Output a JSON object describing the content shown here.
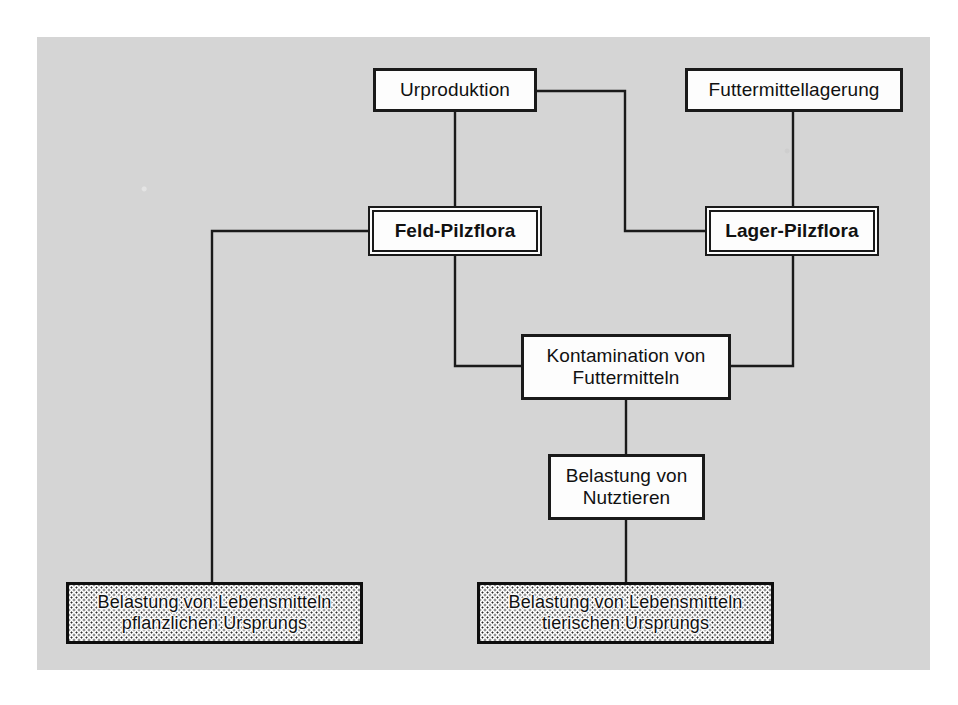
{
  "diagram": {
    "panel_color": "#d5d5d5",
    "line_color": "#1a1a1a",
    "box_fill": "#fdfdfd",
    "text_color": "#111111",
    "nodes": [
      {
        "id": "urproduktion",
        "label": "Urproduktion",
        "style": "plain",
        "x": 373,
        "y": 68,
        "w": 164,
        "h": 44
      },
      {
        "id": "futtermittellagerung",
        "label": "Futtermittellagerung",
        "style": "plain",
        "x": 685,
        "y": 68,
        "w": 218,
        "h": 44
      },
      {
        "id": "feld-pilzflora",
        "label": "Feld-Pilzflora",
        "style": "double",
        "x": 372,
        "y": 210,
        "w": 166,
        "h": 42
      },
      {
        "id": "lager-pilzflora",
        "label": "Lager-Pilzflora",
        "style": "double",
        "x": 709,
        "y": 210,
        "w": 166,
        "h": 42
      },
      {
        "id": "kontamination-von-futtermitteln",
        "label": "Kontamination von\nFuttermitteln",
        "style": "plain",
        "x": 521,
        "y": 334,
        "w": 210,
        "h": 66
      },
      {
        "id": "belastung-von-nutztieren",
        "label": "Belastung von\nNutztieren",
        "style": "plain",
        "x": 548,
        "y": 454,
        "w": 157,
        "h": 66
      },
      {
        "id": "belastung-lebensmittel-pflanzlich",
        "label": "Belastung von Lebensmitteln\npflanzlichen Ursprungs",
        "style": "stippled",
        "x": 66,
        "y": 582,
        "w": 297,
        "h": 62
      },
      {
        "id": "belastung-lebensmittel-tierisch",
        "label": "Belastung von Lebensmitteln\ntierischen Ursprungs",
        "style": "stippled",
        "x": 477,
        "y": 582,
        "w": 297,
        "h": 62
      }
    ],
    "edges": [
      {
        "id": "urproduktion-to-feld-pilzflora",
        "from": "urproduktion",
        "to": "feld-pilzflora",
        "points": "455,112 455,210"
      },
      {
        "id": "urproduktion-to-lager-pilzflora",
        "from": "urproduktion",
        "to": "lager-pilzflora",
        "points": "537,91 625,91 625,231 709,231"
      },
      {
        "id": "futtermittellagerung-to-lager-pilzflora",
        "from": "futtermittellagerung",
        "to": "lager-pilzflora",
        "points": "793,112 793,210"
      },
      {
        "id": "feld-pilzflora-to-kontamination",
        "from": "feld-pilzflora",
        "to": "kontamination-von-futtermitteln",
        "points": "455,252 455,366 521,366"
      },
      {
        "id": "lager-pilzflora-to-kontamination",
        "from": "lager-pilzflora",
        "to": "kontamination-von-futtermitteln",
        "points": "793,252 793,366 731,366"
      },
      {
        "id": "feld-pilzflora-to-lebensmittel-pflanzlich",
        "from": "feld-pilzflora",
        "to": "belastung-lebensmittel-pflanzlich",
        "points": "372,231 212,231 212,582"
      },
      {
        "id": "kontamination-to-nutztiere",
        "from": "kontamination-von-futtermitteln",
        "to": "belastung-von-nutztieren",
        "points": "626,400 626,454"
      },
      {
        "id": "nutztiere-to-lebensmittel-tierisch",
        "from": "belastung-von-nutztieren",
        "to": "belastung-lebensmittel-tierisch",
        "points": "626,520 626,582"
      }
    ]
  }
}
